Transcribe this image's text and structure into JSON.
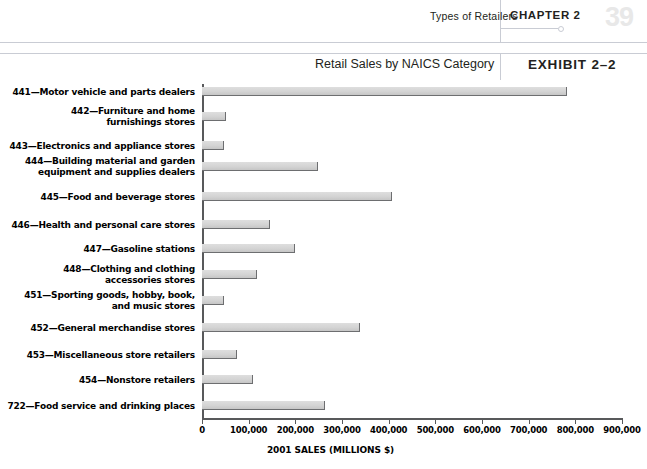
{
  "header": {
    "running_head": "Types of Retailers",
    "chapter_label": "CHAPTER 2",
    "page_number": "39"
  },
  "exhibit": {
    "subtitle": "Retail Sales by NAICS Category",
    "title": "EXHIBIT 2–2"
  },
  "colors": {
    "bar_fill": "#d4d4d4",
    "bar_edge": "#6d6e70",
    "axis": "#58595b",
    "rule": "#c9ccd4",
    "page_number": "#e8e8e8"
  },
  "chart_data": {
    "type": "bar",
    "orientation": "horizontal",
    "title": "Retail Sales by NAICS Category",
    "xlabel": "2001 SALES (MILLIONS $)",
    "ylabel": "",
    "xlim": [
      0,
      900000
    ],
    "grid": false,
    "legend": "none",
    "xticks": [
      0,
      100000,
      200000,
      300000,
      400000,
      500000,
      600000,
      700000,
      800000,
      900000
    ],
    "xtick_labels": [
      "0",
      "100,000",
      "200,000",
      "300,000",
      "400,000",
      "500,000",
      "600,000",
      "700,000",
      "800,000",
      "900,000"
    ],
    "categories": [
      "441—Motor vehicle and parts dealers",
      "442—Furniture and home furnishings stores",
      "443—Electronics and appliance stores",
      "444—Building material and garden equipment and supplies dealers",
      "445—Food and beverage stores",
      "446—Health and personal care stores",
      "447—Gasoline stations",
      "448—Clothing and clothing accessories stores",
      "451—Sporting goods, hobby, book, and music stores",
      "452—General merchandise stores",
      "453—Miscellaneous store retailers",
      "454—Nonstore retailers",
      "722—Food service and drinking places"
    ],
    "category_lines": [
      [
        "441—Motor vehicle and parts dealers"
      ],
      [
        "442—Furniture and home",
        "furnishings stores"
      ],
      [
        "443—Electronics and appliance stores"
      ],
      [
        "444—Building material and garden",
        "equipment and supplies dealers"
      ],
      [
        "445—Food and beverage stores"
      ],
      [
        "446—Health and personal care stores"
      ],
      [
        "447—Gasoline stations"
      ],
      [
        "448—Clothing and clothing",
        "accessories stores"
      ],
      [
        "451—Sporting goods, hobby, book,",
        "and music stores"
      ],
      [
        "452—General merchandise stores"
      ],
      [
        "453—Miscellaneous store retailers"
      ],
      [
        "454—Nonstore retailers"
      ],
      [
        "722—Food service and drinking places"
      ]
    ],
    "values": [
      782000,
      52000,
      47000,
      248000,
      407000,
      145000,
      199000,
      118000,
      47000,
      338000,
      75000,
      109000,
      263000
    ]
  }
}
